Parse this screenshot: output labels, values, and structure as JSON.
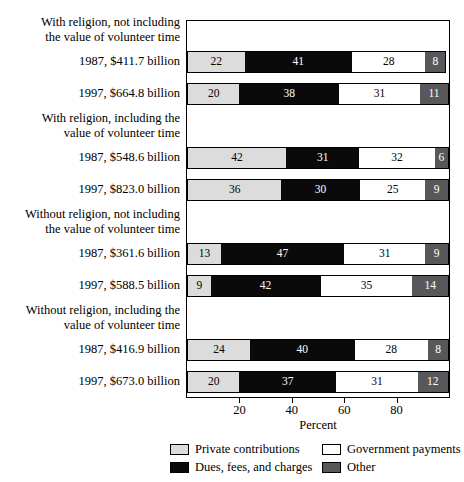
{
  "chart_data": {
    "type": "bar",
    "orientation": "horizontal",
    "stacked": true,
    "stacked_unit": "percent",
    "title": "",
    "xlabel": "Percent",
    "ylabel": "",
    "xlim": [
      0,
      100
    ],
    "xticks": [
      20,
      40,
      60,
      80
    ],
    "xticklabels": [
      "20",
      "40",
      "60",
      "80"
    ],
    "grid": false,
    "legend_position": "bottom",
    "legend": [
      {
        "name": "Private contributions",
        "color": "#dcdcdc"
      },
      {
        "name": "Government payments",
        "color": "#ffffff"
      },
      {
        "name": "Dues, fees, and charges",
        "color": "#0a0a0a"
      },
      {
        "name": "Other",
        "color": "#58585a"
      }
    ],
    "series": [
      {
        "name": "Private contributions",
        "values": [
          22,
          20,
          42,
          36,
          13,
          9,
          24,
          20
        ]
      },
      {
        "name": "Dues, fees, and charges",
        "values": [
          41,
          38,
          31,
          30,
          47,
          42,
          40,
          37
        ]
      },
      {
        "name": "Government payments",
        "values": [
          28,
          31,
          32,
          25,
          31,
          35,
          28,
          31
        ]
      },
      {
        "name": "Other",
        "values": [
          8,
          11,
          6,
          9,
          9,
          14,
          8,
          12
        ]
      }
    ],
    "categories": [
      "1987, $411.7 billion",
      "1997, $664.8 billion",
      "1987, $548.6 billion",
      "1997, $823.0 billion",
      "1987, $361.6 billion",
      "1997, $588.5 billion",
      "1987, $416.9 billion",
      "1997, $673.0 billion"
    ],
    "groups": [
      {
        "heading_line1": "With religion, not including",
        "heading_line2": "the value of volunteer time",
        "bars": [
          {
            "label": "1987, $411.7 billion",
            "private": 22,
            "dues": 41,
            "gov": 28,
            "other": 8
          },
          {
            "label": "1997, $664.8 billion",
            "private": 20,
            "dues": 38,
            "gov": 31,
            "other": 11
          }
        ]
      },
      {
        "heading_line1": "With religion, including the",
        "heading_line2": "value of volunteer time",
        "bars": [
          {
            "label": "1987, $548.6 billion",
            "private": 42,
            "dues": 31,
            "gov": 32,
            "other": 6
          },
          {
            "label": "1997, $823.0 billion",
            "private": 36,
            "dues": 30,
            "gov": 25,
            "other": 9
          }
        ]
      },
      {
        "heading_line1": "Without religion, not including",
        "heading_line2": "the value of volunteer time",
        "bars": [
          {
            "label": "1987, $361.6 billion",
            "private": 13,
            "dues": 47,
            "gov": 31,
            "other": 9
          },
          {
            "label": "1997, $588.5 billion",
            "private": 9,
            "dues": 42,
            "gov": 35,
            "other": 14
          }
        ]
      },
      {
        "heading_line1": "Without religion, including the",
        "heading_line2": "value of volunteer time",
        "bars": [
          {
            "label": "1987, $416.9 billion",
            "private": 24,
            "dues": 40,
            "gov": 28,
            "other": 8
          },
          {
            "label": "1997, $673.0 billion",
            "private": 20,
            "dues": 37,
            "gov": 31,
            "other": 12
          }
        ]
      }
    ]
  }
}
